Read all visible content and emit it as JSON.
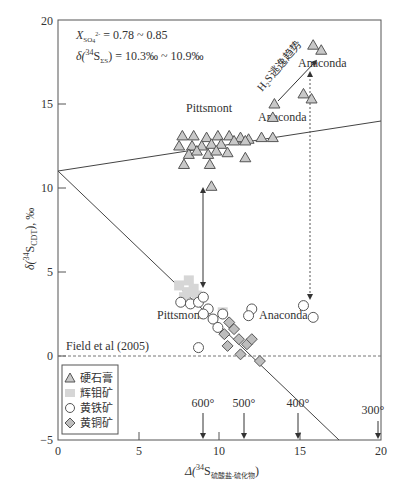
{
  "chart_data": {
    "type": "scatter",
    "title": "",
    "xlabel": "Δ(34S 硫酸盐-硫化物)",
    "xlabel_main": "Δ(",
    "xlabel_sup": "34",
    "xlabel_S": "S",
    "xlabel_sub": "硫酸盐-硫化物",
    "xlabel_close": ")",
    "ylabel": "δ(34S CDT), ‰",
    "xlim": [
      0,
      20
    ],
    "ylim": [
      -5,
      20
    ],
    "xticks": [
      0,
      5,
      10,
      15,
      20
    ],
    "yticks": [
      -5,
      0,
      5,
      10,
      15,
      20
    ],
    "grid": false,
    "legend_position": "lower-left",
    "series": [
      {
        "name": "硬石膏",
        "marker": "triangle",
        "color": "#c8c8c8",
        "points": [
          [
            7.7,
            13.1
          ],
          [
            8.4,
            13.1
          ],
          [
            9.2,
            13.0
          ],
          [
            9.9,
            13.1
          ],
          [
            10.6,
            13.1
          ],
          [
            11.3,
            13.0
          ],
          [
            11.8,
            12.9
          ],
          [
            12.6,
            13.0
          ],
          [
            13.3,
            13.0
          ],
          [
            7.5,
            12.5
          ],
          [
            8.3,
            12.5
          ],
          [
            8.9,
            12.5
          ],
          [
            9.5,
            12.6
          ],
          [
            10.1,
            12.6
          ],
          [
            10.9,
            12.8
          ],
          [
            11.6,
            12.8
          ],
          [
            8.1,
            12.0
          ],
          [
            8.6,
            12.2
          ],
          [
            9.3,
            12.0
          ],
          [
            9.8,
            12.2
          ],
          [
            10.5,
            12.1
          ],
          [
            7.8,
            11.4
          ],
          [
            9.4,
            11.4
          ],
          [
            11.6,
            11.8
          ],
          [
            9.5,
            10.1
          ],
          [
            13.3,
            14.2
          ],
          [
            13.4,
            15.0
          ],
          [
            15.2,
            15.6
          ],
          [
            15.7,
            15.3
          ],
          [
            15.8,
            18.5
          ],
          [
            16.3,
            18.2
          ]
        ]
      },
      {
        "name": "辉钼矿",
        "marker": "square",
        "color": "#d6d6d6",
        "points": [
          [
            7.5,
            4.2
          ],
          [
            8.1,
            4.5
          ],
          [
            8.4,
            4.0
          ],
          [
            8.0,
            3.8
          ],
          [
            7.8,
            3.5
          ],
          [
            8.6,
            3.6
          ],
          [
            10.2,
            2.6
          ]
        ]
      },
      {
        "name": "黄铁矿",
        "marker": "circle",
        "color": "#ffffff",
        "points": [
          [
            7.6,
            3.2
          ],
          [
            8.2,
            3.1
          ],
          [
            8.7,
            3.2
          ],
          [
            9.0,
            3.5
          ],
          [
            9.3,
            2.8
          ],
          [
            9.0,
            2.5
          ],
          [
            9.6,
            2.2
          ],
          [
            9.9,
            1.7
          ],
          [
            10.2,
            2.5
          ],
          [
            8.7,
            0.5
          ],
          [
            12.0,
            2.8
          ],
          [
            11.8,
            2.4
          ],
          [
            15.2,
            3.0
          ],
          [
            15.8,
            2.3
          ]
        ]
      },
      {
        "name": "黄铜矿",
        "marker": "diamond",
        "color": "#bdbdbd",
        "points": [
          [
            10.6,
            2.0
          ],
          [
            10.9,
            1.6
          ],
          [
            10.3,
            1.3
          ],
          [
            11.2,
            1.0
          ],
          [
            11.7,
            0.7
          ],
          [
            10.5,
            0.6
          ],
          [
            12.0,
            1.0
          ],
          [
            11.3,
            0.1
          ],
          [
            12.5,
            -0.3
          ]
        ]
      }
    ],
    "lines": [
      {
        "name": "anhydrite-trend",
        "from": [
          0,
          11.0
        ],
        "to": [
          20,
          14.0
        ],
        "style": "solid"
      },
      {
        "name": "sulfide-trend",
        "from": [
          0,
          11.0
        ],
        "to": [
          17.4,
          -5.0
        ],
        "style": "solid"
      },
      {
        "name": "field-reference",
        "from": [
          0,
          0
        ],
        "to": [
          20,
          0
        ],
        "style": "dashed"
      }
    ],
    "annotations": [
      {
        "text": "X_SO4 = 0.78 ~ 0.85",
        "x": 2.7,
        "y": 18.8
      },
      {
        "text": "δ(34S_ΣS) = 10.3‰ ~ 10.9‰",
        "x": 2.7,
        "y": 17.6
      },
      {
        "text": "Pittsmont",
        "x": 9.2,
        "y": 13.9
      },
      {
        "text": "Anaconda",
        "x": 14.1,
        "y": 14.6
      },
      {
        "text": "Anaconda",
        "x": 16.3,
        "y": 17.2
      },
      {
        "text": "H2S逃逸趋势",
        "x": 12.5,
        "y": 16.5,
        "rotation": -50
      },
      {
        "text": "Pittsmont",
        "x": 6.0,
        "y": 1.9
      },
      {
        "text": "Anaconda",
        "x": 12.0,
        "y": 1.9
      },
      {
        "text": "Field et al (2005)",
        "x": 0.5,
        "y": 0.5
      },
      {
        "text": "600°",
        "x": 8.7,
        "y": -2.4
      },
      {
        "text": "500°",
        "x": 11.4,
        "y": -2.4
      },
      {
        "text": "400°",
        "x": 14.7,
        "y": -2.4
      },
      {
        "text": "300°",
        "x": 19.5,
        "y": -2.9
      }
    ],
    "arrows": [
      {
        "name": "pittsmont-link",
        "x": 9.0,
        "y_from": 4.1,
        "y_to": 10.0,
        "style": "solid",
        "double": true
      },
      {
        "name": "anaconda-link",
        "x": 15.6,
        "y_from": 3.5,
        "y_to": 16.8,
        "style": "dashed",
        "double": true
      },
      {
        "name": "h2s-escape-trend",
        "from": [
          13.6,
          15.2
        ],
        "to": [
          16.0,
          17.8
        ],
        "style": "solid"
      },
      {
        "name": "temp-600",
        "x": 9.0,
        "y_from": -3.4,
        "y_to": -5.0
      },
      {
        "name": "temp-500",
        "x": 11.5,
        "y_from": -3.4,
        "y_to": -5.0
      },
      {
        "name": "temp-400",
        "x": 15.0,
        "y_from": -3.4,
        "y_to": -5.0
      },
      {
        "name": "temp-300",
        "x": 19.8,
        "y_from": -3.8,
        "y_to": -5.0
      }
    ]
  },
  "annotations": {
    "xso4_label": "X",
    "xso4_sub": "SO",
    "xso4_sub2": "4",
    "xso4_sup": "2-",
    "xso4_value": " = 0.78 ~ 0.85",
    "dss_prefix": "δ(",
    "dss_sup": "34",
    "dss_S": "S",
    "dss_sub": "ΣS",
    "dss_value": ") = 10.3‰ ~ 10.9‰",
    "pittsmont_upper": "Pittsmont",
    "anaconda_mid": "Anaconda",
    "anaconda_upper": "Anaconda",
    "h2s_trend": "H₂S逃逸趋势",
    "pittsmont_lower": "Pittsmont",
    "anaconda_lower": "Anaconda",
    "field_ref": "Field et al (2005)",
    "t600": "600°",
    "t500": "500°",
    "t400": "400°",
    "t300": "300°"
  },
  "axes": {
    "x_ticks": [
      "0",
      "5",
      "10",
      "15",
      "20"
    ],
    "y_ticks": [
      "−5",
      "0",
      "5",
      "10",
      "15",
      "20"
    ],
    "y_label_prefix": "δ(",
    "y_label_sup": "34",
    "y_label_S": "S",
    "y_label_sub": "CDT",
    "y_label_suffix": "), ‰",
    "x_label_prefix": "Δ(",
    "x_label_sup": "34",
    "x_label_S": "S",
    "x_label_sub": "硫酸盐-硫化物",
    "x_label_suffix": ")"
  },
  "legend": {
    "items": [
      {
        "label": "硬石膏",
        "marker": "triangle"
      },
      {
        "label": "辉钼矿",
        "marker": "square"
      },
      {
        "label": "黄铁矿",
        "marker": "circle"
      },
      {
        "label": "黄铜矿",
        "marker": "diamond"
      }
    ]
  }
}
